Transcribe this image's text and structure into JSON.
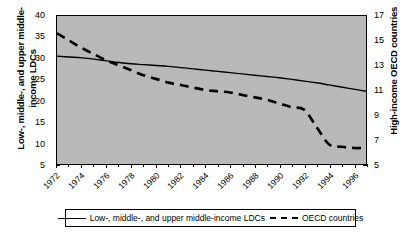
{
  "chart_data": {
    "type": "line",
    "title": "",
    "xlabel": "",
    "x": [
      1972,
      1973,
      1974,
      1975,
      1976,
      1977,
      1978,
      1979,
      1980,
      1981,
      1982,
      1983,
      1984,
      1985,
      1986,
      1987,
      1988,
      1989,
      1990,
      1991,
      1992,
      1993,
      1994,
      1995,
      1996,
      1997
    ],
    "xlim": [
      1972,
      1997
    ],
    "xtick_labels": [
      "1972",
      "1974",
      "1976",
      "1978",
      "1980",
      "1982",
      "1984",
      "1986",
      "1988",
      "1990",
      "1992",
      "1994",
      "1996"
    ],
    "grid": false,
    "legend_position": "bottom",
    "axes": [
      {
        "id": "left",
        "label": "Low-, middle-, and upper middle-income LDCs",
        "ylim": [
          5,
          40
        ],
        "yticks": [
          5,
          10,
          15,
          20,
          25,
          30,
          35,
          40
        ]
      },
      {
        "id": "right",
        "label": "High-income OECD countries",
        "ylim": [
          5,
          17
        ],
        "yticks": [
          5,
          7,
          9,
          11,
          13,
          15,
          17
        ]
      }
    ],
    "series": [
      {
        "name": "Low-, middle-, and upper middle-income LDCs",
        "axis": "left",
        "style": "solid",
        "color": "#000000",
        "values": [
          30.5,
          30.3,
          30.1,
          29.8,
          29.4,
          29.0,
          28.7,
          28.5,
          28.3,
          28.1,
          27.8,
          27.5,
          27.2,
          26.9,
          26.6,
          26.3,
          26.0,
          25.7,
          25.4,
          25.0,
          24.6,
          24.2,
          23.7,
          23.2,
          22.7,
          22.2
        ]
      },
      {
        "name": "OECD countries",
        "axis": "right",
        "style": "dashed",
        "color": "#000000",
        "values": [
          15.6,
          15.0,
          14.4,
          13.9,
          13.4,
          13.0,
          12.6,
          12.2,
          11.9,
          11.6,
          11.4,
          11.2,
          11.0,
          10.9,
          10.8,
          10.6,
          10.4,
          10.2,
          9.9,
          9.6,
          9.4,
          8.0,
          6.6,
          6.4,
          6.3,
          6.3
        ]
      }
    ]
  },
  "legend": {
    "entries": [
      {
        "label": "Low-, middle-, and upper middle-income LDCs",
        "style": "solid"
      },
      {
        "label": "OECD countries",
        "style": "dashed"
      }
    ]
  }
}
